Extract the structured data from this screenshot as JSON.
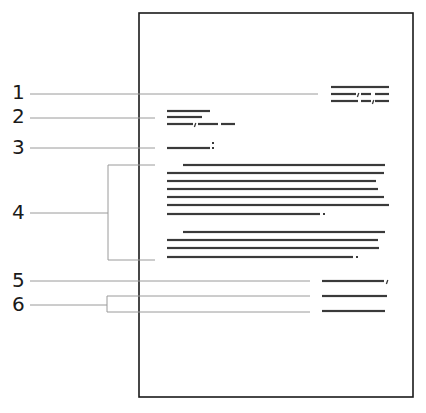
{
  "diagram": {
    "page": {
      "x": 139,
      "y": 13,
      "width": 274,
      "height": 384,
      "border_color": "#1a1a1a"
    },
    "leader_color": "#9a9a9a",
    "text_line_color": "#3a3a3a",
    "callouts": [
      {
        "label": "1",
        "label_x": 12,
        "label_y": 82,
        "line_y": 94,
        "line_x1": 30,
        "line_x2": 318,
        "target": "sender-address"
      },
      {
        "label": "2",
        "label_x": 12,
        "label_y": 106,
        "line_y": 118,
        "line_x1": 30,
        "line_x2": 155,
        "target": "inside-address"
      },
      {
        "label": "3",
        "label_x": 12,
        "label_y": 137,
        "line_y": 148,
        "line_x1": 30,
        "line_x2": 155,
        "target": "salutation"
      },
      {
        "label": "4",
        "label_x": 12,
        "label_y": 202,
        "line_y": 213,
        "line_x1": 30,
        "line_x2": 108,
        "target": "body",
        "bracket": {
          "x": 108,
          "y1": 165,
          "y2": 260,
          "x2": 155
        }
      },
      {
        "label": "5",
        "label_x": 12,
        "label_y": 270,
        "line_y": 281,
        "line_x1": 30,
        "line_x2": 310,
        "target": "complimentary-close"
      },
      {
        "label": "6",
        "label_x": 12,
        "label_y": 294,
        "line_y": 305,
        "line_x1": 30,
        "line_x2": 107,
        "target": "signature",
        "bracket": {
          "x": 107,
          "y1": 296,
          "y2": 312,
          "x2": 310
        }
      }
    ],
    "blocks": {
      "sender_address": [
        {
          "y": 87,
          "segments": [
            [
              331,
              389
            ]
          ]
        },
        {
          "y": 94,
          "segments": [
            [
              331,
              356
            ],
            [
              361,
              371
            ],
            [
              375,
              389
            ]
          ],
          "commas": [
            358
          ]
        },
        {
          "y": 101,
          "segments": [
            [
              331,
              358
            ],
            [
              361,
              371
            ],
            [
              375,
              389
            ]
          ],
          "commas": [
            373
          ]
        }
      ],
      "inside_address": [
        {
          "y": 111,
          "segments": [
            [
              167,
              210
            ]
          ]
        },
        {
          "y": 117,
          "segments": [
            [
              167,
              202
            ]
          ]
        },
        {
          "y": 124,
          "segments": [
            [
              167,
              193
            ],
            [
              198,
              218
            ],
            [
              221,
              235
            ]
          ],
          "commas": [
            195
          ]
        }
      ],
      "salutation": [
        {
          "y": 148,
          "segments": [
            [
              167,
              210
            ]
          ],
          "colon": 212
        }
      ],
      "body": [
        {
          "y": 165,
          "segments": [
            [
              183,
              385
            ]
          ]
        },
        {
          "y": 173,
          "segments": [
            [
              167,
              384
            ]
          ]
        },
        {
          "y": 181,
          "segments": [
            [
              167,
              376
            ]
          ]
        },
        {
          "y": 189,
          "segments": [
            [
              167,
              378
            ]
          ]
        },
        {
          "y": 197,
          "segments": [
            [
              167,
              384
            ]
          ]
        },
        {
          "y": 205,
          "segments": [
            [
              167,
              389
            ]
          ]
        },
        {
          "y": 214,
          "segments": [
            [
              167,
              320
            ]
          ],
          "period": 323
        },
        {
          "y": 232,
          "segments": [
            [
              183,
              385
            ]
          ]
        },
        {
          "y": 240,
          "segments": [
            [
              167,
              378
            ]
          ]
        },
        {
          "y": 248,
          "segments": [
            [
              167,
              379
            ]
          ]
        },
        {
          "y": 257,
          "segments": [
            [
              167,
              353
            ]
          ],
          "period": 356
        }
      ],
      "complimentary_close": [
        {
          "y": 281,
          "segments": [
            [
              322,
              384
            ]
          ],
          "commas": [
            387
          ]
        }
      ],
      "signature": [
        {
          "y": 296,
          "segments": [
            [
              322,
              387
            ]
          ]
        },
        {
          "y": 311,
          "segments": [
            [
              322,
              385
            ]
          ]
        }
      ]
    }
  }
}
